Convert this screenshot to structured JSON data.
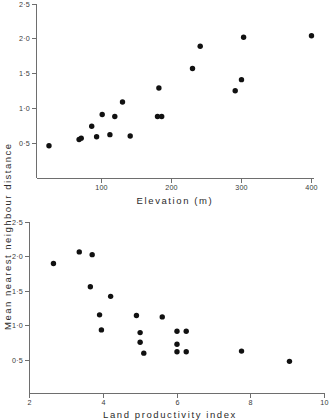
{
  "figure": {
    "background": "#ffffff",
    "point_color": "#111111",
    "axis_color": "#6e6e6e",
    "shared_ylabel": "Mean  nearest  neighbour  distance"
  },
  "chart_data": [
    {
      "type": "scatter",
      "id": "elevation-plot",
      "title": "",
      "xlabel": "Elevation  (m)",
      "ylabel": "Mean nearest neighbour distance",
      "xlim": [
        0,
        420
      ],
      "ylim": [
        0,
        2.5
      ],
      "xticks": [
        100,
        200,
        300,
        400
      ],
      "xtick_labels": [
        "100",
        "200",
        "300",
        "400"
      ],
      "yticks": [
        0.5,
        1.0,
        1.5,
        2.0,
        2.5
      ],
      "ytick_labels": [
        "0·5",
        "1·0",
        "1·5",
        "2·0",
        "2·5"
      ],
      "grid": false,
      "legend": "none",
      "points": [
        {
          "x": 25,
          "y": 0.47
        },
        {
          "x": 68,
          "y": 0.56
        },
        {
          "x": 71,
          "y": 0.58
        },
        {
          "x": 86,
          "y": 0.75
        },
        {
          "x": 93,
          "y": 0.6
        },
        {
          "x": 101,
          "y": 0.92
        },
        {
          "x": 112,
          "y": 0.63
        },
        {
          "x": 119,
          "y": 0.89
        },
        {
          "x": 130,
          "y": 1.1
        },
        {
          "x": 141,
          "y": 0.61
        },
        {
          "x": 180,
          "y": 0.89
        },
        {
          "x": 186,
          "y": 0.89
        },
        {
          "x": 182,
          "y": 1.3
        },
        {
          "x": 230,
          "y": 1.58
        },
        {
          "x": 241,
          "y": 1.9
        },
        {
          "x": 291,
          "y": 1.26
        },
        {
          "x": 300,
          "y": 1.42
        },
        {
          "x": 303,
          "y": 2.03
        },
        {
          "x": 400,
          "y": 2.05
        }
      ]
    },
    {
      "type": "scatter",
      "id": "land-productivity-plot",
      "title": "",
      "xlabel": "Land  productivity  index",
      "ylabel": "Mean nearest neighbour distance",
      "xlim": [
        2,
        10
      ],
      "ylim": [
        0,
        2.5
      ],
      "xticks": [
        2,
        4,
        6,
        8,
        10
      ],
      "xtick_labels": [
        "2",
        "4",
        "6",
        "8",
        "10"
      ],
      "yticks": [
        0.5,
        1.0,
        1.5,
        2.0,
        2.5
      ],
      "ytick_labels": [
        "0·5",
        "1·0",
        "1·5",
        "2·0",
        "2·5"
      ],
      "grid": false,
      "legend": "none",
      "points": [
        {
          "x": 2.65,
          "y": 1.9
        },
        {
          "x": 3.35,
          "y": 2.07
        },
        {
          "x": 3.7,
          "y": 2.03
        },
        {
          "x": 3.65,
          "y": 1.56
        },
        {
          "x": 4.2,
          "y": 1.42
        },
        {
          "x": 3.9,
          "y": 1.15
        },
        {
          "x": 3.95,
          "y": 0.93
        },
        {
          "x": 4.9,
          "y": 1.14
        },
        {
          "x": 5.0,
          "y": 0.89
        },
        {
          "x": 5.0,
          "y": 0.75
        },
        {
          "x": 5.1,
          "y": 0.59
        },
        {
          "x": 5.6,
          "y": 1.12
        },
        {
          "x": 6.0,
          "y": 0.91
        },
        {
          "x": 6.0,
          "y": 0.72
        },
        {
          "x": 6.0,
          "y": 0.61
        },
        {
          "x": 6.25,
          "y": 0.91
        },
        {
          "x": 6.25,
          "y": 0.61
        },
        {
          "x": 7.75,
          "y": 0.62
        },
        {
          "x": 9.05,
          "y": 0.47
        }
      ]
    }
  ]
}
